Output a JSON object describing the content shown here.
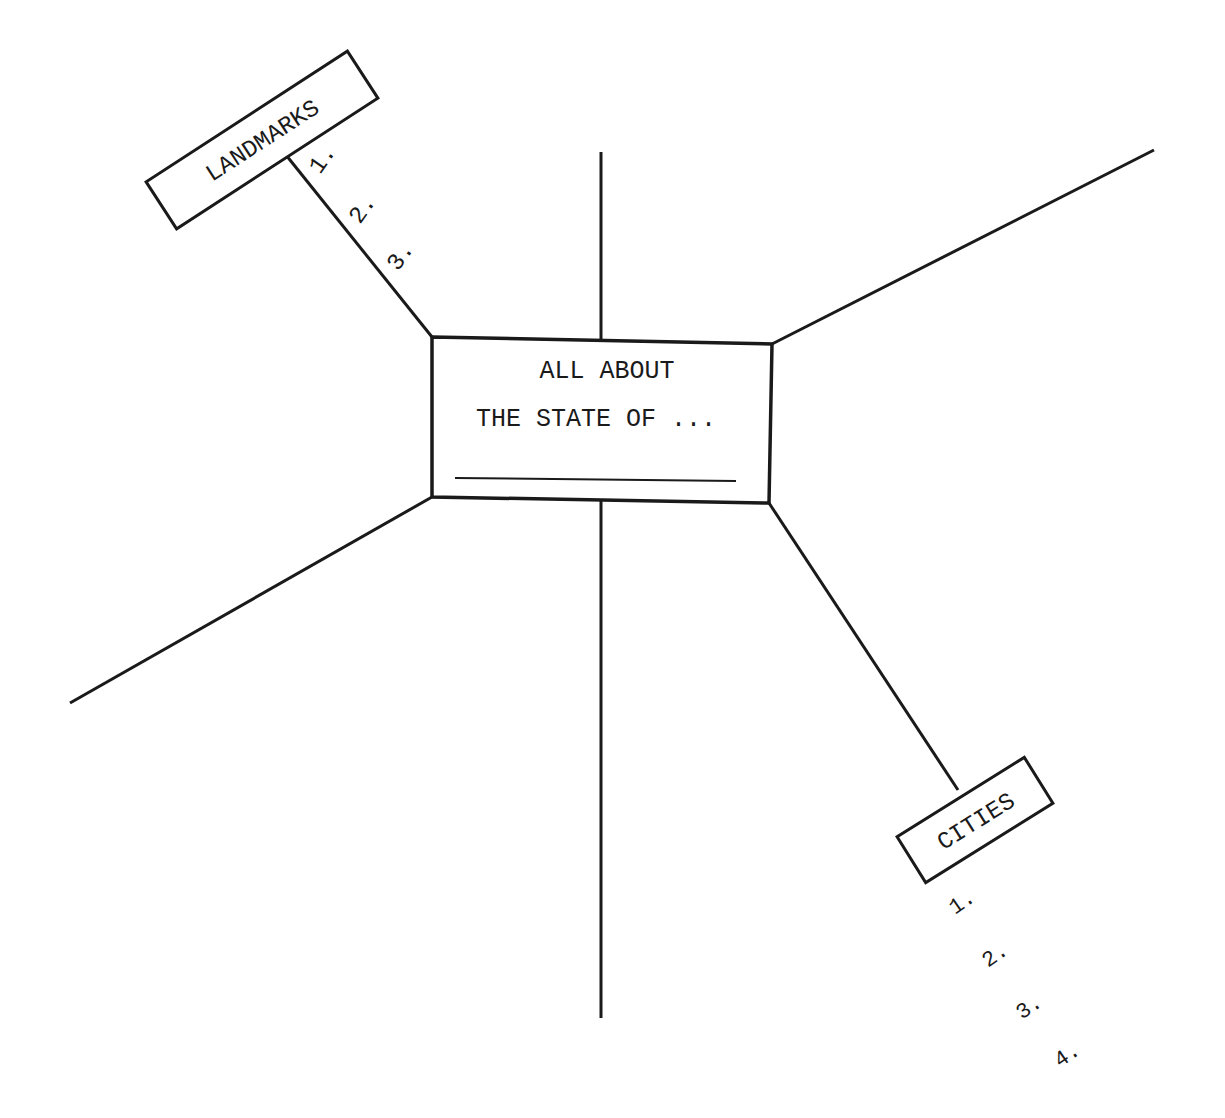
{
  "diagram": {
    "center_box": {
      "line1": "ALL ABOUT",
      "line2": "THE STATE OF ...",
      "blank_line": ""
    },
    "branches": [
      {
        "label": "LANDMARKS",
        "items": [
          "1.",
          "2.",
          "3."
        ]
      },
      {
        "label": "CITIES",
        "items": [
          "1.",
          "2.",
          "3.",
          "4."
        ]
      }
    ],
    "colors": {
      "ink": "#1a1a1a",
      "background": "#ffffff"
    }
  }
}
